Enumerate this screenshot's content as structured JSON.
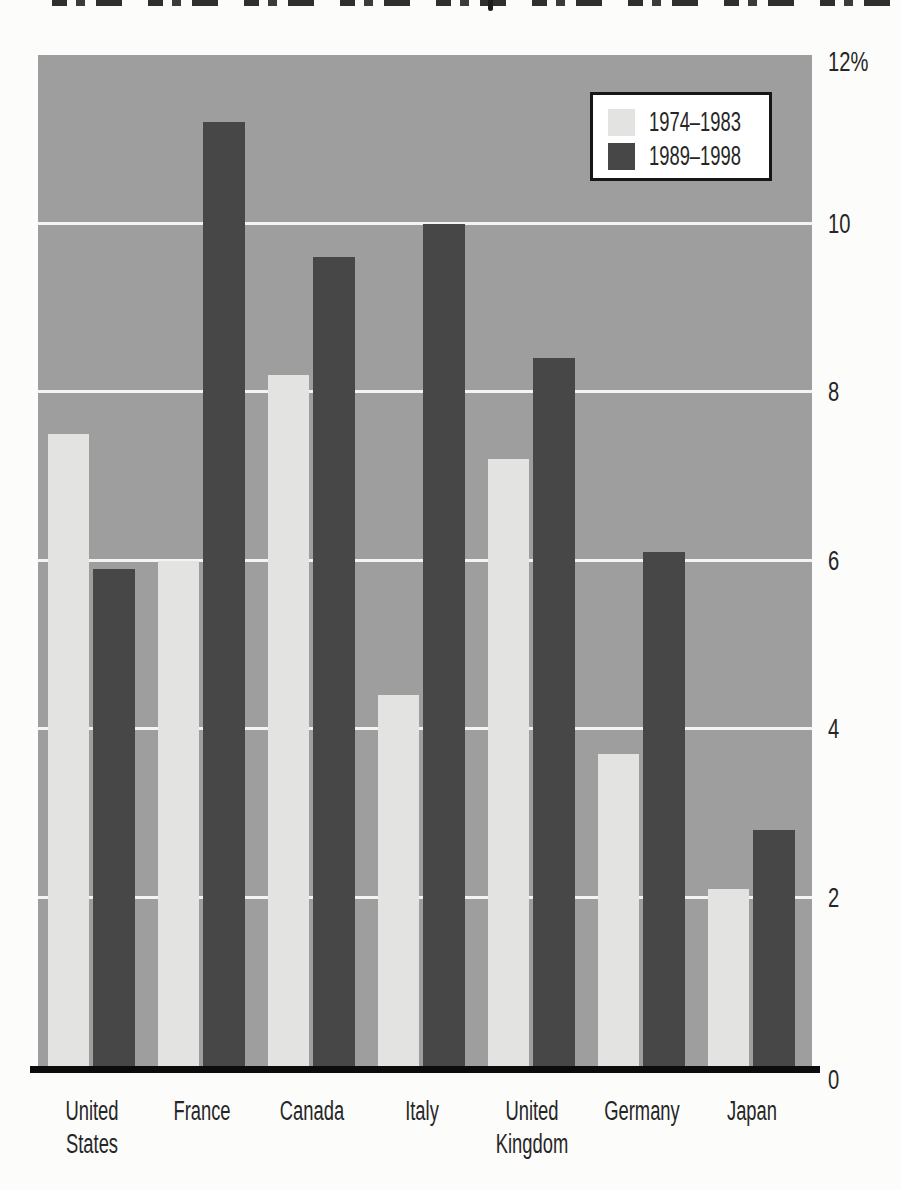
{
  "colors": {
    "plot_background": "#9e9e9e",
    "series_light": "#e3e3e1",
    "series_dark": "#474747",
    "gridline": "#f4f4f3",
    "axis_line": "#0c0c0c",
    "text": "#262626"
  },
  "chart_data": {
    "type": "bar",
    "title": "",
    "categories": [
      "United\nStates",
      "France",
      "Canada",
      "Italy",
      "United\nKingdom",
      "Germany",
      "Japan"
    ],
    "series": [
      {
        "name": "1974–1983",
        "color": "#e3e3e1",
        "values": [
          7.5,
          6.0,
          8.2,
          4.4,
          7.2,
          3.7,
          2.1
        ]
      },
      {
        "name": "1989–1998",
        "color": "#474747",
        "values": [
          5.9,
          11.2,
          9.6,
          10.0,
          8.4,
          6.1,
          2.8
        ]
      }
    ],
    "xlabel": "",
    "ylabel": "",
    "ylim": [
      0,
      12
    ],
    "unit": "%",
    "y_ticks": [
      {
        "label": "12%",
        "value": 12
      },
      {
        "label": "10",
        "value": 10
      },
      {
        "label": "8",
        "value": 8
      },
      {
        "label": "6",
        "value": 6
      },
      {
        "label": "4",
        "value": 4
      },
      {
        "label": "2",
        "value": 2
      },
      {
        "label": "0",
        "value": 0
      }
    ],
    "gridlines_at": [
      2,
      4,
      6,
      8,
      10
    ],
    "grid": true,
    "legend_position": "top-right",
    "legend_entries": [
      "1974–1983",
      "1989–1998"
    ]
  }
}
